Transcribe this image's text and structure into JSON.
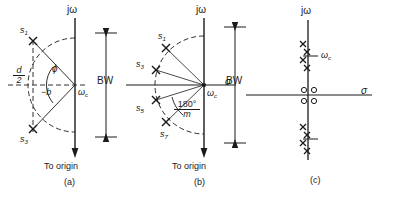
{
  "figure": {
    "axis_labels": {
      "imag": "jω",
      "real": "σ"
    },
    "stroke": "#1a1a1a",
    "bandwidth_label": "BW",
    "to_origin_label": "To origin"
  },
  "panels": [
    {
      "id": "a",
      "caption": "(a)",
      "imag_axis_label": "jω",
      "bandwidth_label": "BW",
      "to_origin_label": "To origin",
      "center_label": "ω",
      "center_sub": "c",
      "sigma_offset_label": "−b",
      "angle_label": "ϕ",
      "radius_num": "d",
      "radius_den": "2",
      "poles": [
        {
          "name": "s",
          "sub": "1"
        },
        {
          "name": "s",
          "sub": "3"
        }
      ]
    },
    {
      "id": "b",
      "caption": "(b)",
      "imag_axis_label": "jω",
      "real_axis_label": "σ",
      "bandwidth_label": "BW",
      "to_origin_label": "To origin",
      "center_label": "ω",
      "center_sub": "c",
      "angle_num": "180°",
      "angle_den": "m",
      "poles": [
        {
          "name": "s",
          "sub": "1"
        },
        {
          "name": "s",
          "sub": "3"
        },
        {
          "name": "s",
          "sub": "5"
        },
        {
          "name": "s",
          "sub": "7"
        }
      ]
    },
    {
      "id": "c",
      "caption": "(c)",
      "imag_axis_label": "jω",
      "real_axis_label": "σ",
      "center_label": "ω",
      "center_sub": "c",
      "pole_clusters": 2,
      "poles_per_cluster": 4,
      "zeros_at_origin": 4
    }
  ]
}
